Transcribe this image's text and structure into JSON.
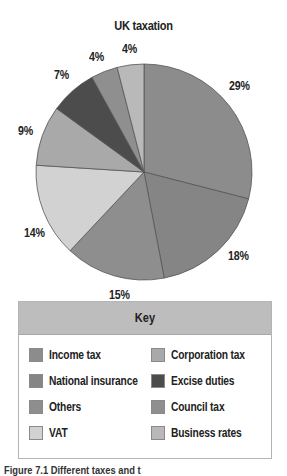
{
  "chart_data": {
    "type": "pie",
    "title": "UK taxation",
    "categories": [
      "Income tax",
      "National insurance",
      "Others",
      "VAT",
      "Corporation tax",
      "Excise duties",
      "Council tax",
      "Business rates"
    ],
    "values": [
      29,
      18,
      15,
      14,
      9,
      7,
      4,
      4
    ],
    "labels": [
      "29%",
      "18%",
      "15%",
      "14%",
      "9%",
      "7%",
      "4%",
      "4%"
    ],
    "colors": [
      "#8c8c8c",
      "#858585",
      "#8e8e8e",
      "#d2d2d2",
      "#a9a9a9",
      "#4c4c4c",
      "#8f8f8f",
      "#b9b9b9"
    ],
    "start_angle": "12 o'clock",
    "direction": "clockwise",
    "legend": {
      "title": "Key",
      "position": "bottom"
    }
  },
  "title": "UK taxation",
  "labels": {
    "income": "29%",
    "ni": "18%",
    "others": "15%",
    "vat": "14%",
    "corp": "9%",
    "excise": "7%",
    "council": "4%",
    "business": "4%"
  },
  "key": {
    "title": "Key",
    "items": [
      {
        "label": "Income tax",
        "color": "#8c8c8c"
      },
      {
        "label": "National insurance",
        "color": "#858585"
      },
      {
        "label": "Others",
        "color": "#8e8e8e"
      },
      {
        "label": "VAT",
        "color": "#d2d2d2"
      },
      {
        "label": "Corporation tax",
        "color": "#a9a9a9"
      },
      {
        "label": "Excise duties",
        "color": "#4c4c4c"
      },
      {
        "label": "Council tax",
        "color": "#8f8f8f"
      },
      {
        "label": "Business rates",
        "color": "#b9b9b9"
      }
    ]
  },
  "caption": "Figure 7.1 Different taxes and t"
}
